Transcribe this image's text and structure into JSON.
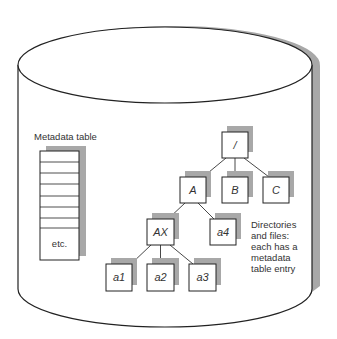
{
  "diagram": {
    "type": "file-system-volume",
    "colors": {
      "stroke": "#222222",
      "shadow": "#a8a8a8",
      "fill": "#ffffff",
      "text": "#333333"
    },
    "metadata_table": {
      "label": "Metadata table",
      "rows": [
        "",
        "",
        "",
        "",
        "",
        "",
        "",
        ""
      ],
      "last_row_label": "etc."
    },
    "tree": {
      "nodes": [
        {
          "id": "root",
          "label": "/"
        },
        {
          "id": "A",
          "label": "A"
        },
        {
          "id": "B",
          "label": "B"
        },
        {
          "id": "C",
          "label": "C"
        },
        {
          "id": "AX",
          "label": "AX"
        },
        {
          "id": "a4",
          "label": "a4"
        },
        {
          "id": "a1",
          "label": "a1"
        },
        {
          "id": "a2",
          "label": "a2"
        },
        {
          "id": "a3",
          "label": "a3"
        }
      ],
      "edges": [
        [
          "root",
          "A"
        ],
        [
          "root",
          "B"
        ],
        [
          "root",
          "C"
        ],
        [
          "A",
          "AX"
        ],
        [
          "A",
          "a4"
        ],
        [
          "AX",
          "a1"
        ],
        [
          "AX",
          "a2"
        ],
        [
          "AX",
          "a3"
        ]
      ]
    },
    "caption": {
      "lines": [
        "Directories",
        "and files:",
        "each has a",
        "metadata",
        "table entry"
      ]
    }
  }
}
